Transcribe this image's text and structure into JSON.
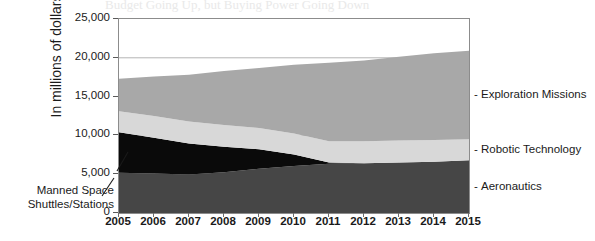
{
  "figure": {
    "bleed_title": "Budget Going Up, but Buying Power Going Down",
    "y_axis_label": "In millions of dollars",
    "callout_line1": "Manned Space",
    "callout_line2": "Shuttles/Stations",
    "y_ticks": [
      "25,000",
      "20,000",
      "15,000",
      "10,000",
      "5,000",
      "0"
    ],
    "legend": [
      {
        "dash": "-",
        "label": "Exploration Missions"
      },
      {
        "dash": "-",
        "label": "Robotic Technology"
      },
      {
        "dash": "-",
        "label": "Aeronautics"
      }
    ],
    "colors": {
      "aeronautics": "#464646",
      "manned_space": "#0a0a0a",
      "robotic_technology": "#d8d8d8",
      "exploration_missions": "#a8a8a8",
      "frame": "#8c8c8c",
      "gridline": "#b4b4b4",
      "text": "#1a1a1a"
    }
  },
  "chart_data": {
    "type": "area",
    "title": "Budget Going Up, but Buying Power Going Down",
    "xlabel": "",
    "ylabel": "In millions of dollars",
    "ylim": [
      0,
      25000
    ],
    "ytick_values": [
      0,
      5000,
      10000,
      15000,
      20000,
      25000
    ],
    "grid": true,
    "legend_position": "right",
    "stacked": true,
    "categories": [
      2005,
      2006,
      2007,
      2008,
      2009,
      2010,
      2011,
      2012,
      2013,
      2014,
      2015
    ],
    "series": [
      {
        "name": "Aeronautics",
        "color": "#464646",
        "values": [
          5200,
          5100,
          4950,
          5250,
          5700,
          6050,
          6350,
          6400,
          6500,
          6600,
          6800
        ]
      },
      {
        "name": "Manned Space Shuttles/Stations",
        "color": "#0a0a0a",
        "values": [
          5200,
          4600,
          4000,
          3300,
          2500,
          1500,
          150,
          0,
          0,
          0,
          0
        ]
      },
      {
        "name": "Robotic Technology",
        "color": "#d8d8d8",
        "values": [
          2700,
          2800,
          2850,
          2800,
          2750,
          2700,
          2750,
          2850,
          2850,
          2800,
          2700
        ]
      },
      {
        "name": "Exploration Missions",
        "color": "#a8a8a8",
        "values": [
          4200,
          5100,
          6000,
          6950,
          7750,
          8850,
          10100,
          10400,
          10800,
          11200,
          11400
        ]
      }
    ],
    "totals": [
      17300,
      17600,
      17800,
      18300,
      18700,
      19100,
      19350,
      19650,
      20150,
      20600,
      20900
    ]
  }
}
